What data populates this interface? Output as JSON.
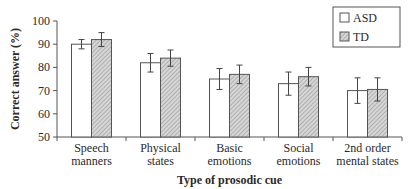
{
  "chart_data": {
    "type": "bar",
    "title": "",
    "xlabel": "Type of prosodic cue",
    "ylabel": "Correct answer (%)",
    "ylim": [
      50,
      100
    ],
    "yticks": [
      50,
      60,
      70,
      80,
      90,
      100
    ],
    "grid": false,
    "legend_position": "upper right",
    "categories": [
      [
        "Speech",
        "manners"
      ],
      [
        "Physical",
        "states"
      ],
      [
        "Basic",
        "emotions"
      ],
      [
        "Social",
        "emotions"
      ],
      [
        "2nd order",
        "mental states"
      ]
    ],
    "category_labels": [
      "Speech manners",
      "Physical states",
      "Basic emotions",
      "Social emotions",
      "2nd order mental states"
    ],
    "series": [
      {
        "name": "ASD",
        "fill": "white",
        "values": [
          90,
          82,
          75,
          73,
          70
        ],
        "errors": [
          2,
          4,
          4.5,
          5,
          5.5
        ]
      },
      {
        "name": "TD",
        "fill": "hatched",
        "values": [
          92,
          84,
          77,
          76,
          70.5
        ],
        "errors": [
          3,
          3.5,
          4,
          4,
          5
        ]
      }
    ]
  },
  "legend": {
    "items": [
      "ASD",
      "TD"
    ]
  }
}
